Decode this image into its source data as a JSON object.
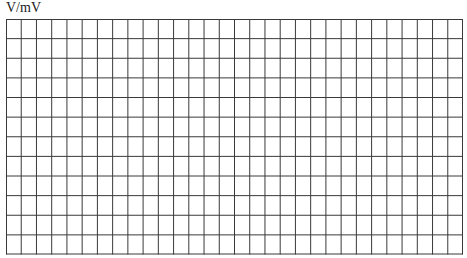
{
  "axis": {
    "y_label": "V/mV"
  },
  "grid": {
    "columns": 30,
    "rows": 12,
    "line_color": "#3a3a3a",
    "background": "#ffffff"
  }
}
